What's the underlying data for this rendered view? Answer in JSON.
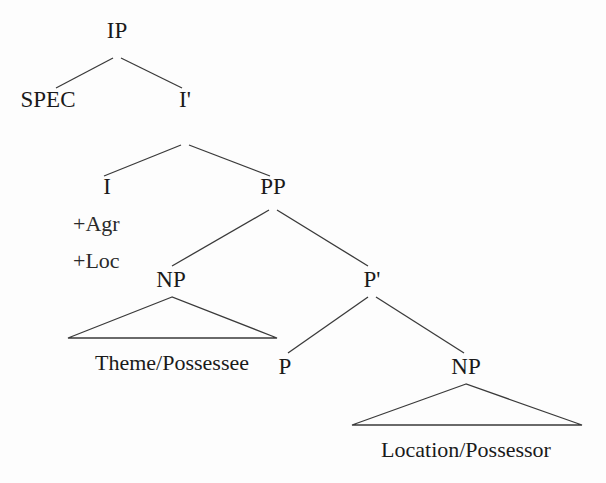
{
  "figure": {
    "type": "syntax-tree",
    "notation": "X-bar",
    "line_color": "#3a3a3a",
    "text_color": "#1a1a1a",
    "background": "#fdfdfd"
  },
  "nodes": {
    "ip": {
      "label": "IP",
      "x": 117,
      "y": 38
    },
    "spec": {
      "label": "SPEC",
      "x": 48,
      "y": 107
    },
    "ibar": {
      "label": "I'",
      "x": 185,
      "y": 107
    },
    "i": {
      "label": "I",
      "x": 107,
      "y": 194
    },
    "pp": {
      "label": "PP",
      "x": 273,
      "y": 194
    },
    "np_left": {
      "label": "NP",
      "x": 171,
      "y": 287
    },
    "pbar": {
      "label": "P'",
      "x": 372,
      "y": 287
    },
    "p": {
      "label": "P",
      "x": 285,
      "y": 374
    },
    "np_right": {
      "label": "NP",
      "x": 466,
      "y": 374
    },
    "theme": {
      "label": "Theme/Possessee",
      "x": 172,
      "y": 370
    },
    "location": {
      "label": "Location/Possessor",
      "x": 466,
      "y": 457
    }
  },
  "features": {
    "agr": {
      "label": "+Agr",
      "x": 73,
      "y": 231
    },
    "loc": {
      "label": "+Loc",
      "x": 73,
      "y": 268
    }
  },
  "edges": [
    {
      "name": "ip-to-spec",
      "x1": 113,
      "y1": 58,
      "x2": 56,
      "y2": 88
    },
    {
      "name": "ip-to-ibar",
      "x1": 121,
      "y1": 58,
      "x2": 182,
      "y2": 88
    },
    {
      "name": "ibar-to-i",
      "x1": 181,
      "y1": 145,
      "x2": 104,
      "y2": 176
    },
    {
      "name": "ibar-to-pp",
      "x1": 189,
      "y1": 145,
      "x2": 270,
      "y2": 176
    },
    {
      "name": "pp-to-np",
      "x1": 269,
      "y1": 210,
      "x2": 172,
      "y2": 266
    },
    {
      "name": "pp-to-pbar",
      "x1": 277,
      "y1": 210,
      "x2": 368,
      "y2": 266
    },
    {
      "name": "pbar-to-p",
      "x1": 368,
      "y1": 297,
      "x2": 288,
      "y2": 353
    },
    {
      "name": "pbar-to-np",
      "x1": 376,
      "y1": 297,
      "x2": 464,
      "y2": 353
    }
  ],
  "triangles": [
    {
      "name": "np-left-triangle",
      "apex_x": 172,
      "apex_y": 297,
      "left_x": 68,
      "right_x": 277,
      "base_y": 338
    },
    {
      "name": "np-right-triangle",
      "apex_x": 466,
      "apex_y": 384,
      "left_x": 352,
      "right_x": 582,
      "base_y": 425
    }
  ]
}
